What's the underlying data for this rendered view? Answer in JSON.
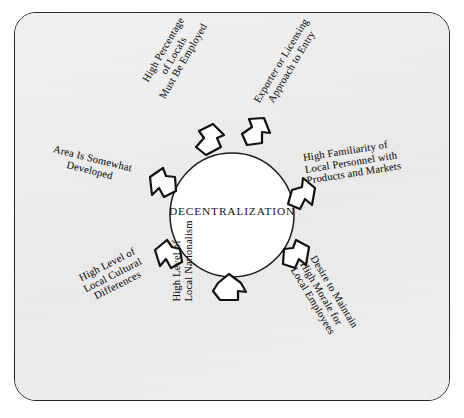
{
  "figure": {
    "type": "radial-arrow-diagram",
    "center_label": "DECENTRALIZATION",
    "frame": {
      "shape": "rounded-rectangle",
      "border_color": "#2b2b2b",
      "background_color": "#efefef"
    },
    "circle": {
      "center_x": 232,
      "center_y": 215,
      "radius": 62,
      "fill": "#ffffff",
      "stroke": "#1a1a1a"
    },
    "arrow_count": 7,
    "arrow_style": "hand-drawn outline pentagon pointing outward",
    "arrow_fill": "#ffffff",
    "arrow_stroke": "#111111"
  },
  "factors": [
    {
      "id": "high-percentage-locals",
      "lines": [
        "High Percentage",
        "of Locals",
        "Must Be Employed"
      ],
      "angle_deg": -60,
      "position": "upper-left"
    },
    {
      "id": "exporter-licensing",
      "lines": [
        "Exporter or Licensing",
        "Approach to Entry"
      ],
      "angle_deg": -59,
      "position": "upper-right"
    },
    {
      "id": "high-familiarity",
      "lines": [
        "High Familiarity of",
        "Local Personnel with",
        "Products and Markets"
      ],
      "angle_deg": -9,
      "position": "right"
    },
    {
      "id": "desire-morale",
      "lines": [
        "Desire to Maintain",
        "High Morale for",
        "Local Employees"
      ],
      "angle_deg": 59,
      "position": "lower-right"
    },
    {
      "id": "high-nationalism",
      "lines": [
        "High Level of",
        "Local Nationalism"
      ],
      "angle_deg": -90,
      "position": "bottom"
    },
    {
      "id": "local-cultural",
      "lines": [
        "High Level of",
        "Local Cultural",
        "Differences"
      ],
      "angle_deg": -27,
      "position": "lower-left"
    },
    {
      "id": "area-developed",
      "lines": [
        "Area Is Somewhat",
        "Developed"
      ],
      "angle_deg": 14,
      "position": "left"
    }
  ]
}
